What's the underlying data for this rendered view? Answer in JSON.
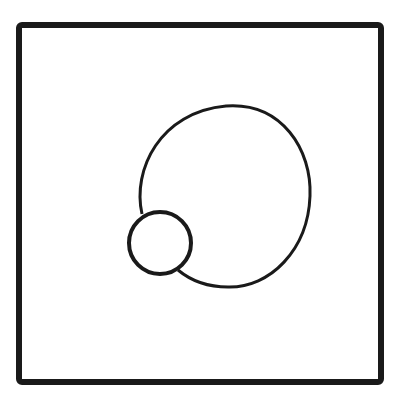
{
  "diagram": {
    "stroke_color": "#1a1a1a",
    "background": "#ffffff",
    "frame": {
      "x": 19,
      "y": 25,
      "width": 362,
      "height": 357,
      "stroke_width": 6
    },
    "large_circle": {
      "cx": 224,
      "cy": 196,
      "rx": 86,
      "ry": 91,
      "stroke_width": 3
    },
    "small_circle": {
      "cx": 160,
      "cy": 243,
      "r": 31,
      "stroke_width": 4
    }
  }
}
